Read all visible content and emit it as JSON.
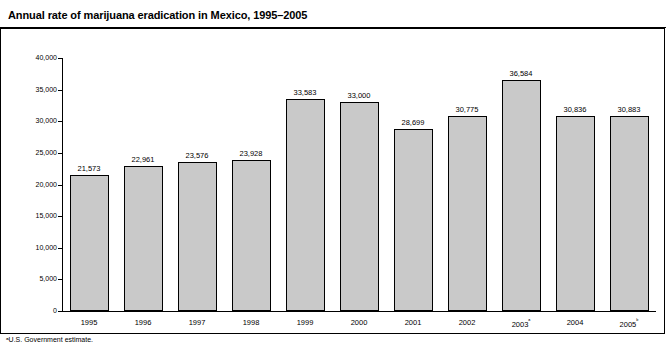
{
  "title": "Annual rate of marijuana eradication in Mexico, 1995–2005",
  "footnote": "ᵃU.S. Government estimate.",
  "chart_data": {
    "type": "bar",
    "title": "Annual rate of marijuana eradication in Mexico, 1995–2005",
    "xlabel": "",
    "ylabel": "Hectares eradicated",
    "categories": [
      "1995",
      "1996",
      "1997",
      "1998",
      "1999",
      "2000",
      "2001",
      "2002",
      "2003ᵃ",
      "2004",
      "2005ᵇ"
    ],
    "values": [
      21573,
      22961,
      23576,
      23928,
      33583,
      33000,
      28699,
      30775,
      36584,
      30836,
      30883
    ],
    "value_labels": [
      "21,573",
      "22,961",
      "23,576",
      "23,928",
      "33,583",
      "33,000",
      "28,699",
      "30,775",
      "36,584",
      "30,836",
      "30,883"
    ],
    "ylim": [
      0,
      40000
    ],
    "yticks": [
      0,
      5000,
      10000,
      15000,
      20000,
      25000,
      30000,
      35000,
      40000
    ],
    "ytick_labels": [
      "0",
      "5,000",
      "10,000",
      "15,000",
      "20,000",
      "25,000",
      "30,000",
      "35,000",
      "40,000"
    ],
    "grid": false,
    "legend": null,
    "bar_color": "#c9c9c9",
    "bar_edge_color": "#000000"
  }
}
